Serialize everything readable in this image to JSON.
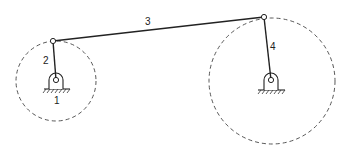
{
  "diagram": {
    "colors": {
      "ink": "#222222",
      "background": "#ffffff"
    },
    "labels": {
      "frame": "1",
      "crank": "2",
      "coupler": "3",
      "rocker": "4"
    },
    "nodes": {
      "left_ground_pivot": {
        "x": 56,
        "y": 80
      },
      "crank_joint": {
        "x": 53,
        "y": 41
      },
      "rocker_joint": {
        "x": 264,
        "y": 17
      },
      "right_ground_pivot": {
        "x": 271,
        "y": 80
      }
    },
    "links": [
      {
        "id": "2",
        "name": "crank",
        "from": "left_ground_pivot",
        "to": "crank_joint"
      },
      {
        "id": "3",
        "name": "coupler",
        "from": "crank_joint",
        "to": "rocker_joint"
      },
      {
        "id": "4",
        "name": "rocker",
        "from": "right_ground_pivot",
        "to": "rocker_joint"
      }
    ],
    "paths": [
      {
        "name": "crank-path",
        "cx": 56,
        "cy": 81,
        "r": 40,
        "style": "dashed"
      },
      {
        "name": "rocker-path",
        "cx": 272,
        "cy": 81,
        "r": 63,
        "style": "dashed"
      }
    ],
    "supports": [
      {
        "name": "left-ground-support",
        "x": 56,
        "y": 80
      },
      {
        "name": "right-ground-support",
        "x": 271,
        "y": 80
      }
    ]
  }
}
